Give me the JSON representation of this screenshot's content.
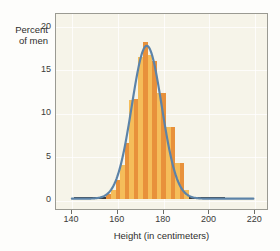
{
  "chart_data": {
    "type": "bar",
    "title": "",
    "xlabel": "Height (in centimeters)",
    "ylabel_line1": "Percent",
    "ylabel_line2": "of men",
    "xlim": [
      133,
      226
    ],
    "ylim": [
      -1.2,
      21.5
    ],
    "xticks": [
      140,
      160,
      180,
      200,
      220
    ],
    "yticks": [
      0,
      5,
      10,
      15,
      20
    ],
    "grid": true,
    "legend": "none",
    "bin_width": 2,
    "categories": [
      156,
      158,
      160,
      162,
      164,
      166,
      168,
      170,
      172,
      174,
      176,
      178,
      180,
      182,
      184,
      186,
      188,
      190
    ],
    "values": [
      0.5,
      1.0,
      2.1,
      3.9,
      6.4,
      11.4,
      11.5,
      16.3,
      18.1,
      16.6,
      15.9,
      12.2,
      12.2,
      8.3,
      8.3,
      4.1,
      4.1,
      1.0
    ],
    "series": [
      {
        "name": "Histogram of men's heights",
        "kind": "bar",
        "values": [
          0.5,
          1.0,
          2.1,
          3.9,
          6.4,
          11.4,
          11.5,
          16.3,
          18.1,
          16.6,
          15.9,
          12.2,
          12.2,
          8.3,
          8.3,
          4.1,
          4.1,
          1.0
        ]
      },
      {
        "name": "Normal density curve",
        "kind": "line",
        "mean": 173,
        "sd": 6.6,
        "peak": 17.8,
        "x_start": 140,
        "x_end": 220
      }
    ],
    "baseline": {
      "y": 0,
      "x_start": 141,
      "x_end": 207
    },
    "annotations": []
  },
  "colors": {
    "bar_dark": "#e8913b",
    "bar_light": "#f5bd5a",
    "curve": "#5c83a8",
    "plot_background": "#f6f4e9",
    "grid": "#ffffff",
    "frame": "#9a9a92",
    "baseline": "#3a3a3a",
    "text": "#2e2e2c"
  }
}
